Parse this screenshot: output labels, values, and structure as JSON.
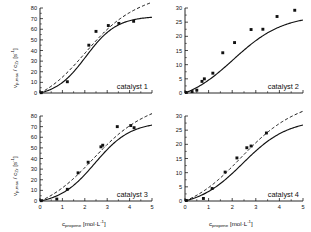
{
  "figure": {
    "background": "#ffffff",
    "ink": "#111111",
    "panel_count": 4
  },
  "axis_titles": {
    "y_main": "v",
    "y_sub": "p,max",
    "y_mid": " / c",
    "y_sub2": "Zr",
    "y_unit": "  [s",
    "y_unit_sup": "-1",
    "y_unit_close": "]",
    "x_main": "c",
    "x_sub": "propene",
    "x_unit": "  [mol·L",
    "x_unit_sup": "-1",
    "x_unit_close": "]"
  },
  "chart_data": [
    {
      "type": "scatter",
      "title": "catalyst 1",
      "xlabel": "c_propene [mol·L^-1]",
      "ylabel": "v_p,max / c_Zr [s^-1]",
      "xlim": [
        0,
        5
      ],
      "ylim": [
        0,
        80
      ],
      "xticks": [
        0,
        1,
        2,
        3,
        4,
        5
      ],
      "xticklabels": [
        "",
        "",
        "",
        "",
        "",
        ""
      ],
      "yticks": [
        0,
        10,
        20,
        30,
        40,
        50,
        60,
        70,
        80
      ],
      "yticklabels": [
        "0",
        "10",
        "20",
        "30",
        "40",
        "50",
        "60",
        "70",
        "80"
      ],
      "grid": false,
      "legend": "none",
      "points": [
        {
          "x": 0.05,
          "y": 0.3
        },
        {
          "x": 1.22,
          "y": 10.6
        },
        {
          "x": 2.18,
          "y": 45.0
        },
        {
          "x": 2.5,
          "y": 58.0
        },
        {
          "x": 3.05,
          "y": 63.5
        },
        {
          "x": 3.52,
          "y": 65.5
        },
        {
          "x": 4.18,
          "y": 67.5
        }
      ],
      "series": [
        {
          "name": "sigmoidal fit",
          "style": "solid"
        },
        {
          "name": "alternative fit",
          "style": "dashed"
        }
      ]
    },
    {
      "type": "scatter",
      "title": "catalyst 2",
      "xlabel": "c_propene [mol·L^-1]",
      "ylabel": "",
      "xlim": [
        0,
        5
      ],
      "ylim": [
        0,
        30
      ],
      "xticks": [
        0,
        1,
        2,
        3,
        4,
        5
      ],
      "xticklabels": [
        "",
        "",
        "",
        "",
        "",
        ""
      ],
      "yticks": [
        0,
        5,
        10,
        15,
        20,
        25,
        30
      ],
      "yticklabels": [
        "0",
        "5",
        "10",
        "15",
        "20",
        "25",
        "30"
      ],
      "grid": false,
      "legend": "none",
      "points": [
        {
          "x": 0.05,
          "y": 0.2
        },
        {
          "x": 0.3,
          "y": 0.5
        },
        {
          "x": 0.5,
          "y": 1.0
        },
        {
          "x": 0.72,
          "y": 4.1
        },
        {
          "x": 0.82,
          "y": 5.0
        },
        {
          "x": 1.18,
          "y": 7.0
        },
        {
          "x": 1.6,
          "y": 14.2
        },
        {
          "x": 2.1,
          "y": 17.8
        },
        {
          "x": 2.8,
          "y": 22.4
        },
        {
          "x": 3.3,
          "y": 22.5
        },
        {
          "x": 3.9,
          "y": 27.0
        },
        {
          "x": 4.65,
          "y": 29.2
        }
      ],
      "series": [
        {
          "name": "sigmoidal fit",
          "style": "solid"
        }
      ]
    },
    {
      "type": "scatter",
      "title": "catalyst 3",
      "xlabel": "c_propene [mol·L^-1]",
      "ylabel": "v_p,max / c_Zr [s^-1]",
      "xlim": [
        0,
        5
      ],
      "ylim": [
        0,
        80
      ],
      "xticks": [
        0,
        1,
        2,
        3,
        4,
        5
      ],
      "xticklabels": [
        "0",
        "1",
        "2",
        "3",
        "4",
        "5"
      ],
      "yticks": [
        0,
        10,
        20,
        30,
        40,
        50,
        60,
        70,
        80
      ],
      "yticklabels": [
        "0",
        "10",
        "20",
        "30",
        "40",
        "50",
        "60",
        "70",
        "80"
      ],
      "grid": false,
      "legend": "none",
      "points": [
        {
          "x": 0.05,
          "y": 0.3
        },
        {
          "x": 0.75,
          "y": 1.8
        },
        {
          "x": 1.22,
          "y": 11.0
        },
        {
          "x": 1.7,
          "y": 26.5
        },
        {
          "x": 2.15,
          "y": 36.5
        },
        {
          "x": 2.72,
          "y": 51.0
        },
        {
          "x": 2.8,
          "y": 52.5
        },
        {
          "x": 3.45,
          "y": 70.0
        },
        {
          "x": 4.05,
          "y": 71.0
        },
        {
          "x": 4.2,
          "y": 69.0
        }
      ],
      "series": [
        {
          "name": "sigmoidal fit",
          "style": "solid"
        },
        {
          "name": "alternative fit",
          "style": "dashed"
        }
      ]
    },
    {
      "type": "scatter",
      "title": "catalyst 4",
      "xlabel": "c_propene [mol·L^-1]",
      "ylabel": "",
      "xlim": [
        0,
        5
      ],
      "ylim": [
        0,
        30
      ],
      "xticks": [
        0,
        1,
        2,
        3,
        4,
        5
      ],
      "xticklabels": [
        "0",
        "1",
        "2",
        "3",
        "4",
        "5"
      ],
      "yticks": [
        0,
        5,
        10,
        15,
        20,
        25,
        30
      ],
      "yticklabels": [
        "0",
        "5",
        "10",
        "15",
        "20",
        "25",
        "30"
      ],
      "grid": false,
      "legend": "none",
      "points": [
        {
          "x": 0.05,
          "y": 0.2
        },
        {
          "x": 0.78,
          "y": 0.9
        },
        {
          "x": 1.15,
          "y": 4.4
        },
        {
          "x": 1.7,
          "y": 10.2
        },
        {
          "x": 2.2,
          "y": 15.2
        },
        {
          "x": 2.62,
          "y": 18.8
        },
        {
          "x": 2.8,
          "y": 19.4
        },
        {
          "x": 3.45,
          "y": 24.0
        }
      ],
      "series": [
        {
          "name": "sigmoidal fit",
          "style": "solid"
        },
        {
          "name": "alternative fit",
          "style": "dashed"
        }
      ]
    }
  ]
}
